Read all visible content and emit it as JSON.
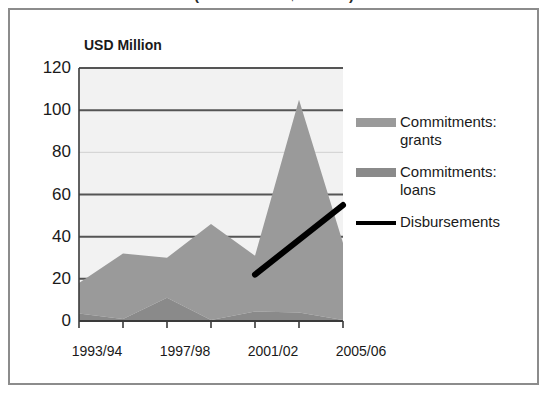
{
  "title": {
    "text": "(values in US$ million)",
    "clipped": true
  },
  "axis_unit_label": "USD Million",
  "legend": {
    "items": [
      {
        "label": "Commitments:\ngrants",
        "swatch": "area-swatch-grants",
        "color": "#9a9a9a",
        "type": "area"
      },
      {
        "label": "Commitments:\nloans",
        "swatch": "area-swatch-loans",
        "color": "#8a8a8a",
        "type": "area"
      },
      {
        "label": "Disbursements",
        "swatch": "line-swatch-disbursements",
        "color": "#000000",
        "type": "line"
      }
    ]
  },
  "chart_data": {
    "type": "area",
    "title": "(values in US$ million)",
    "xlabel": "",
    "ylabel": "USD Million",
    "ylim": [
      0,
      120
    ],
    "yticks": [
      0,
      20,
      40,
      60,
      80,
      100,
      120
    ],
    "ytick_labels": [
      "0",
      "20",
      "40",
      "60",
      "80",
      "100",
      "120"
    ],
    "grid": true,
    "legend_position": "right",
    "stacked": true,
    "x": [
      "1993/94",
      "1995/96",
      "1997/98",
      "1999/00",
      "2001/02",
      "2003/04",
      "2005/06"
    ],
    "xtick_labels": [
      "1993/94",
      "1997/98",
      "2001/02",
      "2005/06"
    ],
    "xtick_label_x": [
      "1993/94",
      "1997/98",
      "2001/02",
      "2005/06"
    ],
    "series": [
      {
        "name": "Commitments: loans",
        "color": "#8a8a8a",
        "type": "area",
        "values": [
          3.5,
          1.0,
          11.0,
          0.5,
          4.5,
          4.0,
          0.5
        ]
      },
      {
        "name": "Commitments: grants",
        "color": "#9a9a9a",
        "type": "area",
        "values": [
          14.5,
          31.0,
          19.0,
          45.5,
          26.5,
          101.0,
          36.5
        ]
      },
      {
        "name": "Disbursements",
        "color": "#000000",
        "type": "line",
        "x": [
          "2001/02",
          "2005/06"
        ],
        "values": [
          22,
          55
        ]
      }
    ],
    "totals": [
      18,
      32,
      30,
      46,
      31,
      105,
      37
    ]
  },
  "colors": {
    "grants": "#9a9a9a",
    "loans": "#8a8a8a",
    "disbursements": "#000000",
    "plot_background": "#f2f2f2",
    "gridline": "#555555",
    "gridline_light": "#d0d0d0",
    "axis": "#3a3a3a",
    "frame": "#8c8c8c",
    "text": "#1a1a1a"
  }
}
